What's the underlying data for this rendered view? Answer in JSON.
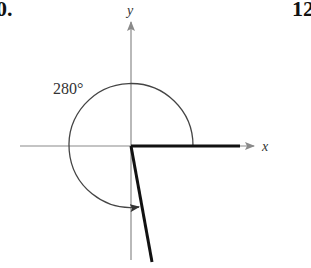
{
  "problem_numbers": {
    "left": "0.",
    "right": "12"
  },
  "diagram": {
    "angle_label": "280°",
    "x_axis_label": "x",
    "y_axis_label": "y",
    "angle_degrees": 280,
    "colors": {
      "axis": "#8a8a8a",
      "side": "#111111",
      "arc": "#444444"
    }
  }
}
